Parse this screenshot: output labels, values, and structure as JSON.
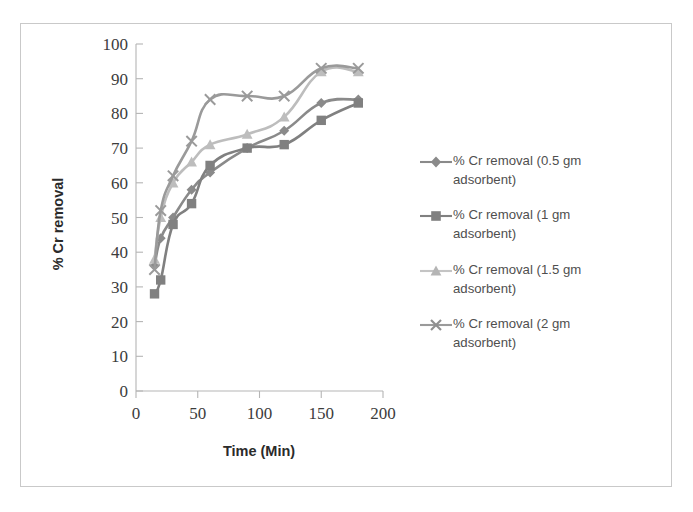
{
  "chart_data": {
    "type": "line",
    "title": "",
    "xlabel": "Time  (Min)",
    "ylabel": "% Cr removal",
    "xlim": [
      0,
      200
    ],
    "ylim": [
      0,
      100
    ],
    "xticks": [
      "0",
      "50",
      "100",
      "150",
      "200"
    ],
    "yticks": [
      "0",
      "10",
      "20",
      "30",
      "40",
      "50",
      "60",
      "70",
      "80",
      "90",
      "100"
    ],
    "grid": false,
    "legend_position": "right",
    "x": [
      15,
      20,
      30,
      45,
      60,
      90,
      120,
      150,
      180
    ],
    "series": [
      {
        "name": "% Cr removal (0.5 gm adsorbent)",
        "marker": "diamond",
        "color": "#8a8a8a",
        "values": [
          36,
          44,
          50,
          58,
          63,
          70,
          75,
          83,
          84
        ]
      },
      {
        "name": "% Cr removal (1  gm adsorbent)",
        "marker": "square",
        "color": "#808080",
        "values": [
          28,
          32,
          48,
          54,
          65,
          70,
          71,
          78,
          83
        ]
      },
      {
        "name": "% Cr removal (1.5 gm adsorbent)",
        "marker": "triangle",
        "color": "#bdbdbd",
        "values": [
          38,
          50,
          60,
          66,
          71,
          74,
          79,
          92,
          92
        ]
      },
      {
        "name": "% Cr removal (2 gm adsorbent)",
        "marker": "cross",
        "color": "#9a9a9a",
        "values": [
          35,
          52,
          62,
          72,
          84,
          85,
          85,
          93,
          93
        ]
      }
    ]
  },
  "axes": {
    "y_title": "% Cr removal",
    "x_title": "Time  (Min)",
    "y_ticks": [
      "100",
      "90",
      "80",
      "70",
      "60",
      "50",
      "40",
      "30",
      "20",
      "10",
      "0"
    ],
    "x_ticks": [
      "0",
      "50",
      "100",
      "150",
      "200"
    ]
  },
  "legend": {
    "items": [
      {
        "label": "% Cr removal (0.5 gm adsorbent)",
        "marker": "diamond-marker-icon"
      },
      {
        "label": "% Cr removal (1  gm adsorbent)",
        "marker": "square-marker-icon"
      },
      {
        "label": "% Cr removal (1.5 gm adsorbent)",
        "marker": "triangle-marker-icon"
      },
      {
        "label": "% Cr removal (2 gm adsorbent)",
        "marker": "cross-marker-icon"
      }
    ]
  },
  "colors": {
    "series_0": "#8a8a8a",
    "series_1": "#808080",
    "series_2": "#bdbdbd",
    "series_3": "#9a9a9a",
    "axis": "#b0b0b0",
    "text": "#3c3c3c",
    "frame": "#c9c9c9"
  }
}
